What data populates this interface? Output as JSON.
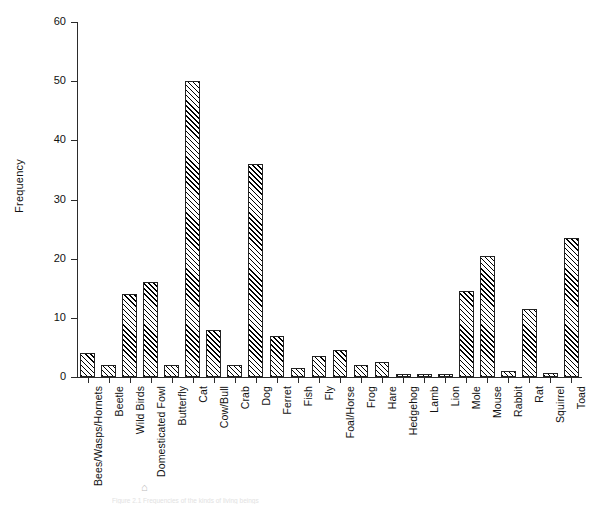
{
  "figure": {
    "top_caption_remnant": "",
    "bottom_caption": "Figure 2.1 Frequencies of the kinds of living beings",
    "bottom_glyph": "⌂"
  },
  "chart_data": {
    "type": "bar",
    "title": "",
    "xlabel": "",
    "ylabel": "Frequency",
    "ylim": [
      0,
      60
    ],
    "yticks": [
      0,
      10,
      20,
      30,
      40,
      50,
      60
    ],
    "ytick_labels": [
      "0",
      "10",
      "20",
      "30",
      "40",
      "50",
      "60"
    ],
    "grid": false,
    "legend": null,
    "categories": [
      "Bees/Wasps/Hornets",
      "Beetle",
      "Wild Birds",
      "Domesticated Fowl",
      "Butterfly",
      "Cat",
      "Cow/Bull",
      "Crab",
      "Dog",
      "Ferret",
      "Fish",
      "Fly",
      "Foal/Horse",
      "Frog",
      "Hare",
      "Hedgehog",
      "Lamb",
      "Lion",
      "Mole",
      "Mouse",
      "Rabbit",
      "Rat",
      "Squirrel",
      "Toad"
    ],
    "values": [
      4,
      2,
      14,
      16,
      2,
      50,
      8,
      2,
      36,
      7,
      1.5,
      3.5,
      4.5,
      2,
      2.5,
      0.5,
      0.5,
      0.5,
      14.5,
      20.5,
      1,
      11.5,
      0.7,
      23.5
    ],
    "bar_style": {
      "fill": "hatch-forward-diagonal",
      "edge_color": "#222222",
      "face_color": "#ffffff"
    }
  }
}
